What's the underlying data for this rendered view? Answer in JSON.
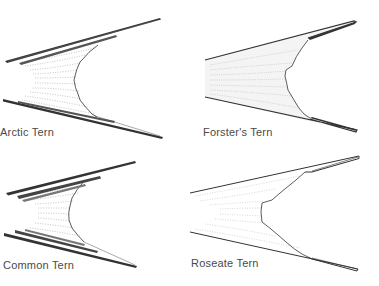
{
  "figure": {
    "type": "tern tail comparison illustration",
    "line_color": "#333333",
    "fill_color": "#ffffff",
    "panels": [
      {
        "id": "arctic",
        "label": "Arctic Tern",
        "position": "top-left"
      },
      {
        "id": "forsters",
        "label": "Forster's Tern",
        "position": "top-right"
      },
      {
        "id": "common",
        "label": "Common Tern",
        "position": "bottom-left"
      },
      {
        "id": "roseate",
        "label": "Roseate Tern",
        "position": "bottom-right"
      }
    ]
  }
}
